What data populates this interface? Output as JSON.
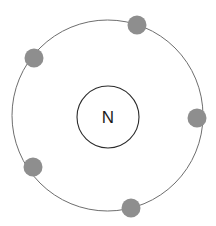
{
  "figure": {
    "name": "bohr-atom-diagram",
    "width": 216,
    "height": 226,
    "background_color": "#ffffff"
  },
  "nucleus": {
    "label": "N",
    "element_symbol": "N",
    "cx": 108,
    "cy": 117,
    "r": 31,
    "stroke_color": "#2b2b2b",
    "stroke_width": 1.1,
    "fill_color": "#ffffff",
    "label_color": "#1b1b1b",
    "label_font_size": 17
  },
  "shells": [
    {
      "name": "valence-shell",
      "index": 1,
      "cx": 107.5,
      "cy": 115.5,
      "r": 95.5,
      "stroke_color": "#6e6e6e",
      "stroke_width": 1.0,
      "electron_count": 5
    }
  ],
  "electrons": [
    {
      "name": "electron-top",
      "cx": 137,
      "cy": 25,
      "r": 9.5,
      "color": "#8e8e8e"
    },
    {
      "name": "electron-upper-left",
      "cx": 34,
      "cy": 58,
      "r": 9.5,
      "color": "#8e8e8e"
    },
    {
      "name": "electron-right",
      "cx": 197,
      "cy": 118,
      "r": 9.5,
      "color": "#8e8e8e"
    },
    {
      "name": "electron-lower-left",
      "cx": 33,
      "cy": 167,
      "r": 9.5,
      "color": "#8e8e8e"
    },
    {
      "name": "electron-bottom",
      "cx": 131,
      "cy": 208,
      "r": 9.5,
      "color": "#8e8e8e"
    }
  ],
  "chart_data": {
    "type": "diagram",
    "title": "",
    "subtype": "bohr-model",
    "element_symbol": "N",
    "shell_radii": [
      95.5
    ],
    "electrons_per_shell": [
      5
    ],
    "total_electrons": 5,
    "nucleus_radius": 31,
    "center": [
      107.5,
      115.5
    ],
    "labels": [
      "N"
    ],
    "legend": [],
    "grid": false
  }
}
